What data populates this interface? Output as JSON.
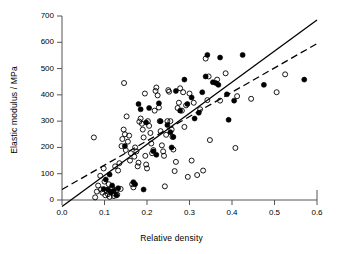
{
  "chart_data": {
    "type": "scatter",
    "title": "",
    "xlabel": "Relative density",
    "ylabel": "Elastic modulus / MPa",
    "xlim": [
      0.0,
      0.6
    ],
    "ylim": [
      0,
      700
    ],
    "xticks": [
      "0.0",
      "0.1",
      "0.2",
      "0.3",
      "0.4",
      "0.5",
      "0.6"
    ],
    "xtick_values": [
      0.0,
      0.1,
      0.2,
      0.3,
      0.4,
      0.5,
      0.6
    ],
    "yticks": [
      "0",
      "100",
      "200",
      "300",
      "400",
      "500",
      "600",
      "700"
    ],
    "ytick_values": [
      0,
      100,
      200,
      300,
      400,
      500,
      600,
      700
    ],
    "grid": false,
    "legend": "none",
    "series": [
      {
        "name": "open-circles",
        "marker": "open-circle",
        "color": "#000000",
        "fill": "none",
        "points": [
          [
            0.075,
            238
          ],
          [
            0.078,
            10
          ],
          [
            0.082,
            32
          ],
          [
            0.085,
            55
          ],
          [
            0.09,
            92
          ],
          [
            0.092,
            40
          ],
          [
            0.095,
            28
          ],
          [
            0.098,
            120
          ],
          [
            0.1,
            70
          ],
          [
            0.102,
            18
          ],
          [
            0.105,
            35
          ],
          [
            0.108,
            22
          ],
          [
            0.11,
            60
          ],
          [
            0.112,
            12
          ],
          [
            0.115,
            30
          ],
          [
            0.118,
            45
          ],
          [
            0.12,
            25
          ],
          [
            0.122,
            15
          ],
          [
            0.125,
            128
          ],
          [
            0.128,
            38
          ],
          [
            0.13,
            20
          ],
          [
            0.132,
            112
          ],
          [
            0.135,
            140
          ],
          [
            0.138,
            42
          ],
          [
            0.14,
            205
          ],
          [
            0.142,
            232
          ],
          [
            0.145,
            268
          ],
          [
            0.146,
            445
          ],
          [
            0.148,
            250
          ],
          [
            0.15,
            190
          ],
          [
            0.152,
            318
          ],
          [
            0.155,
            222
          ],
          [
            0.158,
            245
          ],
          [
            0.16,
            150
          ],
          [
            0.162,
            178
          ],
          [
            0.165,
            60
          ],
          [
            0.168,
            48
          ],
          [
            0.17,
            165
          ],
          [
            0.172,
            200
          ],
          [
            0.175,
            185
          ],
          [
            0.178,
            128
          ],
          [
            0.18,
            142
          ],
          [
            0.182,
            298
          ],
          [
            0.185,
            310
          ],
          [
            0.188,
            290
          ],
          [
            0.19,
            268
          ],
          [
            0.192,
            238
          ],
          [
            0.195,
            405
          ],
          [
            0.196,
            168
          ],
          [
            0.198,
            135
          ],
          [
            0.2,
            120
          ],
          [
            0.202,
            300
          ],
          [
            0.205,
            282
          ],
          [
            0.208,
            255
          ],
          [
            0.21,
            215
          ],
          [
            0.212,
            178
          ],
          [
            0.215,
            190
          ],
          [
            0.218,
            340
          ],
          [
            0.22,
            415
          ],
          [
            0.222,
            428
          ],
          [
            0.225,
            398
          ],
          [
            0.228,
            352
          ],
          [
            0.23,
            300
          ],
          [
            0.232,
            262
          ],
          [
            0.235,
            208
          ],
          [
            0.238,
            185
          ],
          [
            0.24,
            168
          ],
          [
            0.242,
            52
          ],
          [
            0.245,
            248
          ],
          [
            0.248,
            300
          ],
          [
            0.25,
            418
          ],
          [
            0.252,
            412
          ],
          [
            0.255,
            300
          ],
          [
            0.258,
            268
          ],
          [
            0.26,
            240
          ],
          [
            0.262,
            192
          ],
          [
            0.265,
            110
          ],
          [
            0.268,
            145
          ],
          [
            0.272,
            350
          ],
          [
            0.275,
            370
          ],
          [
            0.278,
            425
          ],
          [
            0.282,
            340
          ],
          [
            0.285,
            410
          ],
          [
            0.288,
            278
          ],
          [
            0.292,
            360
          ],
          [
            0.296,
            88
          ],
          [
            0.3,
            405
          ],
          [
            0.305,
            150
          ],
          [
            0.31,
            370
          ],
          [
            0.318,
            95
          ],
          [
            0.325,
            345
          ],
          [
            0.332,
            112
          ],
          [
            0.338,
            538
          ],
          [
            0.342,
            380
          ],
          [
            0.345,
            470
          ],
          [
            0.348,
            228
          ],
          [
            0.365,
            458
          ],
          [
            0.372,
            378
          ],
          [
            0.385,
            482
          ],
          [
            0.408,
            198
          ],
          [
            0.412,
            395
          ],
          [
            0.445,
            385
          ],
          [
            0.505,
            410
          ],
          [
            0.525,
            478
          ]
        ]
      },
      {
        "name": "filled-circles",
        "marker": "filled-circle",
        "color": "#000000",
        "fill": "#000000",
        "points": [
          [
            0.098,
            42
          ],
          [
            0.103,
            78
          ],
          [
            0.108,
            40
          ],
          [
            0.112,
            97
          ],
          [
            0.115,
            30
          ],
          [
            0.118,
            55
          ],
          [
            0.122,
            35
          ],
          [
            0.128,
            18
          ],
          [
            0.132,
            45
          ],
          [
            0.148,
            205
          ],
          [
            0.168,
            68
          ],
          [
            0.172,
            60
          ],
          [
            0.18,
            365
          ],
          [
            0.185,
            345
          ],
          [
            0.192,
            40
          ],
          [
            0.198,
            295
          ],
          [
            0.205,
            350
          ],
          [
            0.215,
            185
          ],
          [
            0.222,
            172
          ],
          [
            0.228,
            368
          ],
          [
            0.232,
            300
          ],
          [
            0.248,
            285
          ],
          [
            0.255,
            258
          ],
          [
            0.258,
            200
          ],
          [
            0.262,
            240
          ],
          [
            0.268,
            415
          ],
          [
            0.278,
            340
          ],
          [
            0.288,
            458
          ],
          [
            0.295,
            365
          ],
          [
            0.305,
            390
          ],
          [
            0.312,
            310
          ],
          [
            0.322,
            332
          ],
          [
            0.33,
            410
          ],
          [
            0.338,
            470
          ],
          [
            0.342,
            552
          ],
          [
            0.355,
            448
          ],
          [
            0.362,
            445
          ],
          [
            0.368,
            438
          ],
          [
            0.372,
            542
          ],
          [
            0.388,
            402
          ],
          [
            0.392,
            305
          ],
          [
            0.405,
            378
          ],
          [
            0.425,
            552
          ],
          [
            0.475,
            438
          ],
          [
            0.57,
            458
          ]
        ]
      }
    ],
    "trend_lines": [
      {
        "name": "solid-trend-line",
        "style": "solid",
        "color": "#000000",
        "x_start": 0.0,
        "y_start": -25,
        "x_end": 0.6,
        "y_end": 685
      },
      {
        "name": "dashed-trend-line",
        "style": "dashed",
        "color": "#000000",
        "x_start": 0.0,
        "y_start": 40,
        "x_end": 0.6,
        "y_end": 595
      }
    ]
  }
}
